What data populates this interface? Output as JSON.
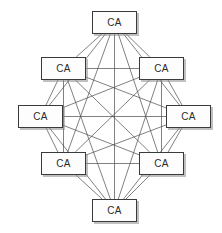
{
  "diagram": {
    "type": "node-graph",
    "topology": "complete-graph",
    "node_count": 8,
    "edge_count": 28,
    "canvas": {
      "width": 222,
      "height": 233
    },
    "style": {
      "background_color": "#ffffff",
      "node_fill": "#fdfdfd",
      "node_border_color": "#3a3a3a",
      "node_shadow_color": "#8c8c8c",
      "edge_color": "#4a4a4a",
      "label_color": "#2b2b2b"
    },
    "nodes": [
      {
        "id": "ca-top",
        "label": "CA",
        "position": "top",
        "x": 92,
        "y": 11,
        "w": 45,
        "h": 23,
        "cx": 114.5,
        "cy": 22.5
      },
      {
        "id": "ca-top-left",
        "label": "CA",
        "position": "top-left",
        "x": 41,
        "y": 57,
        "w": 45,
        "h": 23,
        "cx": 63.5,
        "cy": 68.5
      },
      {
        "id": "ca-top-right",
        "label": "CA",
        "position": "top-right",
        "x": 139,
        "y": 57,
        "w": 45,
        "h": 23,
        "cx": 161.5,
        "cy": 68.5
      },
      {
        "id": "ca-left",
        "label": "CA",
        "position": "left",
        "x": 18,
        "y": 105,
        "w": 45,
        "h": 23,
        "cx": 40.5,
        "cy": 116.5
      },
      {
        "id": "ca-right",
        "label": "CA",
        "position": "right",
        "x": 166,
        "y": 105,
        "w": 45,
        "h": 23,
        "cx": 188.5,
        "cy": 116.5
      },
      {
        "id": "ca-bottom-left",
        "label": "CA",
        "position": "bottom-left",
        "x": 41,
        "y": 152,
        "w": 45,
        "h": 23,
        "cx": 63.5,
        "cy": 163.5
      },
      {
        "id": "ca-bottom-right",
        "label": "CA",
        "position": "bottom-right",
        "x": 139,
        "y": 152,
        "w": 45,
        "h": 23,
        "cx": 161.5,
        "cy": 163.5
      },
      {
        "id": "ca-bottom",
        "label": "CA",
        "position": "bottom",
        "x": 92,
        "y": 199,
        "w": 45,
        "h": 23,
        "cx": 114.5,
        "cy": 210.5
      }
    ],
    "edges": [
      [
        "ca-top",
        "ca-top-left"
      ],
      [
        "ca-top",
        "ca-top-right"
      ],
      [
        "ca-top",
        "ca-left"
      ],
      [
        "ca-top",
        "ca-right"
      ],
      [
        "ca-top",
        "ca-bottom-left"
      ],
      [
        "ca-top",
        "ca-bottom-right"
      ],
      [
        "ca-top",
        "ca-bottom"
      ],
      [
        "ca-top-left",
        "ca-top-right"
      ],
      [
        "ca-top-left",
        "ca-left"
      ],
      [
        "ca-top-left",
        "ca-right"
      ],
      [
        "ca-top-left",
        "ca-bottom-left"
      ],
      [
        "ca-top-left",
        "ca-bottom-right"
      ],
      [
        "ca-top-left",
        "ca-bottom"
      ],
      [
        "ca-top-right",
        "ca-left"
      ],
      [
        "ca-top-right",
        "ca-right"
      ],
      [
        "ca-top-right",
        "ca-bottom-left"
      ],
      [
        "ca-top-right",
        "ca-bottom-right"
      ],
      [
        "ca-top-right",
        "ca-bottom"
      ],
      [
        "ca-left",
        "ca-right"
      ],
      [
        "ca-left",
        "ca-bottom-left"
      ],
      [
        "ca-left",
        "ca-bottom-right"
      ],
      [
        "ca-left",
        "ca-bottom"
      ],
      [
        "ca-right",
        "ca-bottom-left"
      ],
      [
        "ca-right",
        "ca-bottom-right"
      ],
      [
        "ca-right",
        "ca-bottom"
      ],
      [
        "ca-bottom-left",
        "ca-bottom-right"
      ],
      [
        "ca-bottom-left",
        "ca-bottom"
      ],
      [
        "ca-bottom-right",
        "ca-bottom"
      ]
    ]
  }
}
